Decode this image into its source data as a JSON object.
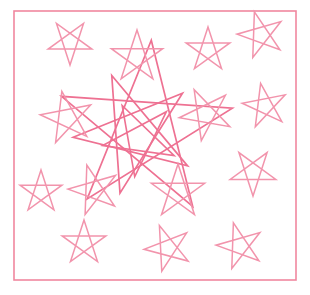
{
  "canvas": {
    "width": 310,
    "height": 295,
    "background_color": "#FFFFFF",
    "title": "pentagram-star-scatter"
  },
  "frame": {
    "name": "border-frame",
    "x": 14,
    "y": 11,
    "width": 282,
    "height": 269,
    "stroke_color": "#F0879F",
    "stroke_width": 1.6
  },
  "style": {
    "stroke_color": "#EE7192",
    "stroke_color_light": "#F294AC",
    "stroke_width_small": 1.5,
    "stroke_width_large": 1.6,
    "star_type": "pentagram",
    "star_points": 5,
    "star_skip": 2
  },
  "stars": [
    {
      "id": "star-center-large-1",
      "cx": 145,
      "cy": 130,
      "r": 90,
      "rotation": 4,
      "stroke_width": 1.7
    },
    {
      "id": "star-center-large-2",
      "cx": 135,
      "cy": 133,
      "r": 62,
      "rotation": 194,
      "stroke_width": 1.7
    },
    {
      "id": "star-center-large-3",
      "cx": 140,
      "cy": 139,
      "r": 38,
      "rotation": 188,
      "stroke_width": 1.6
    },
    {
      "id": "star-top-left",
      "cx": 70,
      "cy": 42,
      "r": 23,
      "rotation": 180,
      "stroke_width": 1.5
    },
    {
      "id": "star-top-mid",
      "cx": 137,
      "cy": 57,
      "r": 27,
      "rotation": 0,
      "stroke_width": 1.5
    },
    {
      "id": "star-top-right-inner",
      "cx": 208,
      "cy": 50,
      "r": 23,
      "rotation": 0,
      "stroke_width": 1.5
    },
    {
      "id": "star-top-right-corner",
      "cx": 261,
      "cy": 35,
      "r": 24,
      "rotation": 200,
      "stroke_width": 1.5
    },
    {
      "id": "star-left-upper",
      "cx": 67,
      "cy": 118,
      "r": 27,
      "rotation": 205,
      "stroke_width": 1.5
    },
    {
      "id": "star-right-upper",
      "cx": 206,
      "cy": 114,
      "r": 27,
      "rotation": 190,
      "stroke_width": 1.5
    },
    {
      "id": "star-right-edge",
      "cx": 265,
      "cy": 106,
      "r": 23,
      "rotation": 205,
      "stroke_width": 1.5
    },
    {
      "id": "star-right-mid",
      "cx": 253,
      "cy": 172,
      "r": 24,
      "rotation": 180,
      "stroke_width": 1.5
    },
    {
      "id": "star-left-lower",
      "cx": 41,
      "cy": 192,
      "r": 22,
      "rotation": 0,
      "stroke_width": 1.5
    },
    {
      "id": "star-left-mid-lower",
      "cx": 94,
      "cy": 190,
      "r": 26,
      "rotation": 200,
      "stroke_width": 1.5
    },
    {
      "id": "star-mid-lower",
      "cx": 178,
      "cy": 192,
      "r": 28,
      "rotation": 0,
      "stroke_width": 1.5
    },
    {
      "id": "star-bottom-left",
      "cx": 84,
      "cy": 243,
      "r": 23,
      "rotation": 0,
      "stroke_width": 1.5
    },
    {
      "id": "star-bottom-mid",
      "cx": 168,
      "cy": 248,
      "r": 24,
      "rotation": 195,
      "stroke_width": 1.5
    },
    {
      "id": "star-bottom-right",
      "cx": 240,
      "cy": 246,
      "r": 24,
      "rotation": 200,
      "stroke_width": 1.5
    }
  ],
  "counts": {
    "total_stars": 17,
    "large_center_stars": 3,
    "small_scattered_stars": 14
  }
}
